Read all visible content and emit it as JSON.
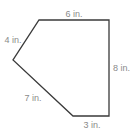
{
  "figure": {
    "shape": "pentagon",
    "stroke_color": "#3a3a3a",
    "label_color": "#8a8a8a",
    "vertices": [
      [
        39,
        20
      ],
      [
        109,
        20
      ],
      [
        109,
        116
      ],
      [
        73,
        116
      ],
      [
        13,
        60
      ]
    ],
    "sides": [
      {
        "name": "top",
        "label": "6 in.",
        "x": 74,
        "y": 17
      },
      {
        "name": "right",
        "label": "8 in.",
        "x": 115,
        "y": 71
      },
      {
        "name": "bottom",
        "label": "3 in.",
        "x": 92,
        "y": 128
      },
      {
        "name": "lower-left",
        "label": "7 in.",
        "x": 33,
        "y": 101
      },
      {
        "name": "upper-left",
        "label": "4 in.",
        "x": 13,
        "y": 43
      }
    ]
  }
}
